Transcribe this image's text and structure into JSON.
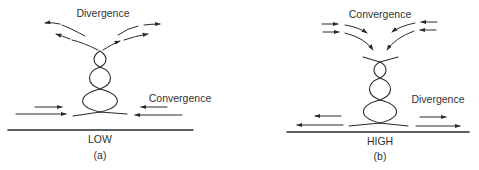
{
  "panels": [
    {
      "id": "a",
      "caption": "(a)",
      "pressure_label": "LOW",
      "top_label": "Divergence",
      "bottom_label": "Convergence",
      "top_flow": "outward",
      "bottom_flow": "inward"
    },
    {
      "id": "b",
      "caption": "(b)",
      "pressure_label": "HIGH",
      "top_label": "Convergence",
      "bottom_label": "Divergence",
      "top_flow": "inward",
      "bottom_flow": "outward"
    }
  ],
  "colors": {
    "ink": "#2a2a2a",
    "background": "#ffffff"
  }
}
